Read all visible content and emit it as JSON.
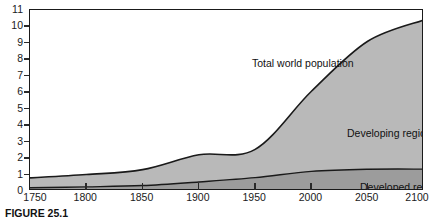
{
  "figure": {
    "caption": "FIGURE 25.1"
  },
  "labels": {
    "total": "Total world population",
    "developing": "Developing regions",
    "developed": "Developed regions"
  },
  "colors": {
    "developing_fill": "#b9b9b9",
    "developed_fill": "#9c9c9c",
    "line": "#1a1a1a",
    "frame": "#1a1a1a",
    "background": "#ffffff"
  },
  "chart_data": {
    "type": "area",
    "title": "",
    "subtitle": "",
    "xlabel": "",
    "ylabel": "",
    "stacked": true,
    "grid": false,
    "legend": "in-plot annotations",
    "xlim": [
      1750,
      2100
    ],
    "ylim": [
      0,
      11
    ],
    "xticks": [
      1750,
      1800,
      1850,
      1900,
      1950,
      2000,
      2050,
      2100
    ],
    "yticks": [
      0,
      1,
      2,
      3,
      4,
      5,
      6,
      7,
      8,
      9,
      10,
      11
    ],
    "x": [
      1750,
      1800,
      1850,
      1900,
      1950,
      2000,
      2050,
      2100
    ],
    "series": [
      {
        "name": "Developed regions",
        "values": [
          0.2,
          0.25,
          0.33,
          0.55,
          0.81,
          1.19,
          1.32,
          1.33
        ]
      },
      {
        "name": "Developing regions",
        "values": [
          0.6,
          0.75,
          0.97,
          1.65,
          1.72,
          4.87,
          7.78,
          9.07
        ]
      }
    ],
    "total": {
      "name": "Total world population",
      "values": [
        0.8,
        1.0,
        1.3,
        2.2,
        2.53,
        6.06,
        9.1,
        10.4
      ]
    },
    "annotations": [
      {
        "text": "Total world population",
        "x": 1930,
        "y": 7.9
      },
      {
        "text": "Developing regions",
        "x": 2015,
        "y": 4.4
      },
      {
        "text": "Developed regions",
        "x": 2025,
        "y": 1.1
      }
    ]
  }
}
